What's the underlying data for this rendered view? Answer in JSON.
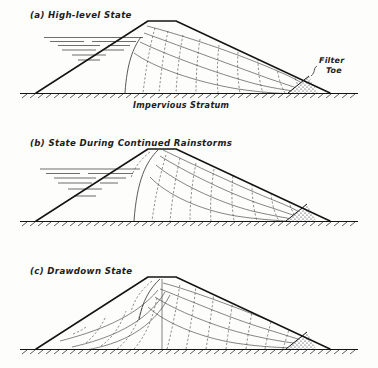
{
  "figure": {
    "kind": "engineering-cross-section",
    "background_color": "#fdfdfb",
    "ink_color": "#141414"
  },
  "panels": [
    {
      "id": "a",
      "caption": "(a) High-level State",
      "annotations": [
        {
          "name": "filter-toe",
          "line1": "Filter",
          "line2": "Toe"
        },
        {
          "name": "impervious-stratum",
          "text": "Impervious Stratum"
        }
      ],
      "features": {
        "reservoir": "high level against upstream face, shown as horizontal dashed water lines",
        "phreatic_surface": "enters at reservoir level on upstream slope, falls to filter toe",
        "filter_toe": "stippled triangle at downstream toe",
        "flow_lines": 4,
        "equipotential_lines": 9
      }
    },
    {
      "id": "b",
      "caption": "(b) State During Continued Rainstorms",
      "annotations": [],
      "features": {
        "reservoir": "lowered level, horizontal dashed water lines",
        "phreatic_surface": "enters at the crest due to rainfall infiltration",
        "filter_toe": "stippled triangle at downstream toe",
        "flow_lines": 4,
        "equipotential_lines": 8
      }
    },
    {
      "id": "c",
      "caption": "(c) Drawdown State",
      "annotations": [],
      "features": {
        "reservoir": "emptied / drawn down, no water shown",
        "phreatic_surface": "saturated body drains to both faces",
        "filter_toe": "stippled triangle at downstream toe",
        "centre_line": "vertical line beneath the crest",
        "flow_lines": 6,
        "equipotential_lines": 13
      }
    }
  ],
  "legend_semantics": {
    "solid_curves": "flow lines (stream lines)",
    "dashed_curves": "equipotential lines",
    "hatched_baseline": "impervious stratum",
    "stippled_wedge": "filter toe (rock drain)"
  }
}
